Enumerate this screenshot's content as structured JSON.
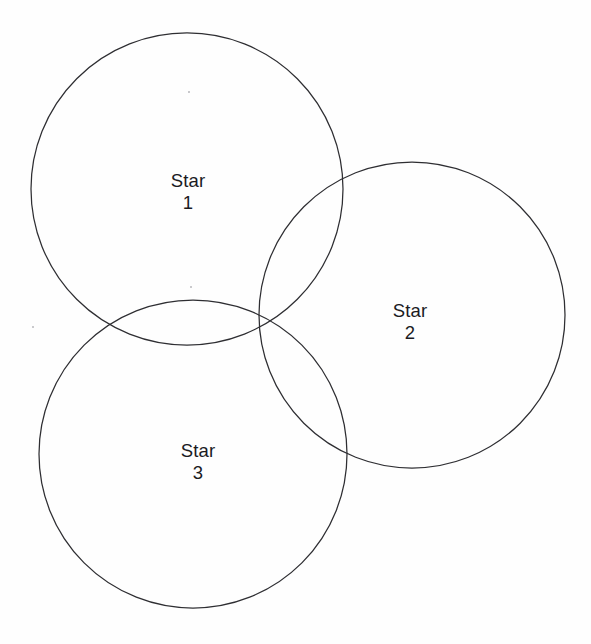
{
  "figure": {
    "type": "venn-diagram",
    "title": "",
    "background_color": "#fefefe",
    "stroke_color": "#2e2e32",
    "stroke_width": 1.25,
    "text_color": "#1b1b1f",
    "width": 591,
    "height": 644
  },
  "sets": [
    {
      "id": "star-1",
      "name": "Star",
      "number": "1",
      "circle": {
        "cx": 187,
        "cy": 189,
        "r": 156
      },
      "label_position": {
        "x": 188,
        "y": 192
      }
    },
    {
      "id": "star-2",
      "name": "Star",
      "number": "2",
      "circle": {
        "cx": 412,
        "cy": 315,
        "r": 153
      },
      "label_position": {
        "x": 410,
        "y": 322
      }
    },
    {
      "id": "star-3",
      "name": "Star",
      "number": "3",
      "circle": {
        "cx": 193,
        "cy": 454,
        "r": 154
      },
      "label_position": {
        "x": 198,
        "y": 462
      }
    }
  ],
  "artifacts": [
    {
      "id": "speck-upper",
      "x": 191,
      "y": 287,
      "size": 2.5
    },
    {
      "id": "speck-left",
      "x": 33,
      "y": 327,
      "size": 2.5
    },
    {
      "id": "speck-top",
      "x": 189,
      "y": 92,
      "size": 1.8
    }
  ]
}
